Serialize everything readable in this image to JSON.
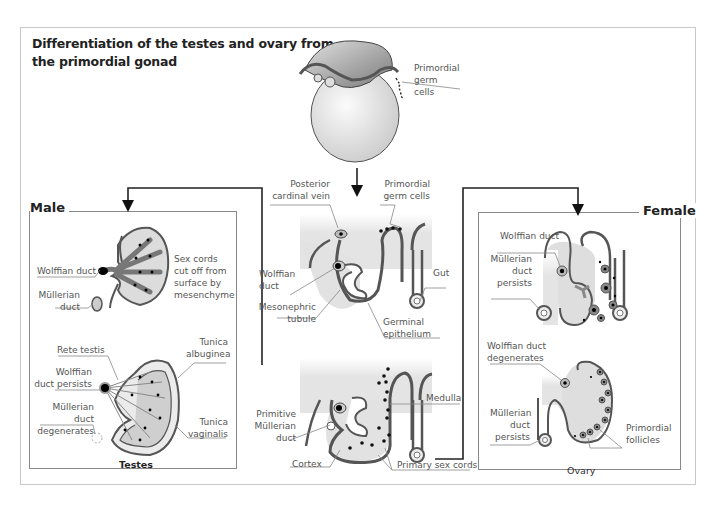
{
  "title": "Differentiation of the testes and ovary from the primordial gonad",
  "top": {
    "label_primordial_germ_cells": "Primordial germ cells"
  },
  "middle_upper": {
    "labels": {
      "posterior_cardinal_vein": "Posterior cardinal vein",
      "primordial_germ_cells": "Primordial germ cells",
      "wolffian_duct": "Wolffian duct",
      "gut": "Gut",
      "mesonephric_tubule": "Mesonephric tubule",
      "germinal_epithelium": "Germinal epithelium"
    }
  },
  "middle_lower": {
    "labels": {
      "medulla": "Medulla",
      "primitive_mullerian_duct": "Primitive Müllerian duct",
      "cortex": "Cortex",
      "primary_sex_cords": "Primary sex cords"
    }
  },
  "male": {
    "heading": "Male",
    "caption": "Testes",
    "labels": {
      "wolffian_duct": "Wolffian duct",
      "sex_cords": "Sex cords cut off from surface by mesenchyme",
      "mullerian_duct": "Müllerian duct",
      "rete_testis": "Rete testis",
      "tunica_albuginea": "Tunica albuginea",
      "wolffian_duct_persists": "Wolffian duct persists",
      "mullerian_duct_degenerates": "Müllerian duct degenerates",
      "tunica_vaginalis": "Tunica vaginalis"
    }
  },
  "female": {
    "heading": "Female",
    "caption": "Ovary",
    "labels": {
      "wolffian_duct": "Wolffian duct",
      "mullerian_duct_persists": "Müllerian duct persists",
      "wolffian_duct_degenerates": "Wolffian duct degenerates",
      "mullerian_duct_persists_2": "Müllerian duct persists",
      "primordial_follicles": "Primordial follicles"
    }
  }
}
